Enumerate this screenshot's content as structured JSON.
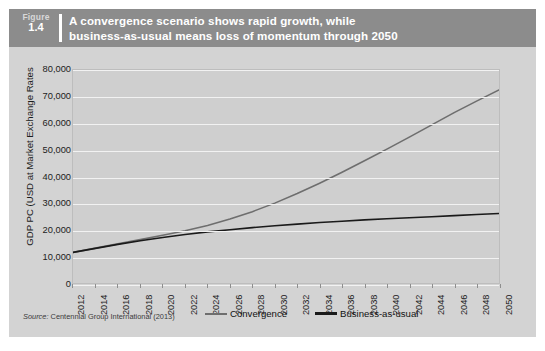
{
  "figure": {
    "label": "Figure",
    "number": "1.4",
    "title_line1": "A convergence scenario shows rapid growth, while",
    "title_line2": "business-as-usual means loss of momentum through 2050",
    "source": "Centennial Group International (2013)",
    "source_label": "Source:"
  },
  "colors": {
    "card_background": "#d3d3d3",
    "header_background": "#8c8c8c",
    "header_text": "#ffffff",
    "plot_background": "#cfcfcf",
    "gridline": "#f2f2f2",
    "convergence_line": "#6e6e6e",
    "business_as_usual_line": "#1a1a1a"
  },
  "chart_data": {
    "type": "line",
    "title": "A convergence scenario shows rapid growth, while business-as-usual means loss of momentum through 2050",
    "xlabel": "",
    "ylabel": "GDP PC (USD at Market Exchange Rates",
    "xlim": [
      2012,
      2050
    ],
    "ylim": [
      0,
      80000
    ],
    "ytick_values": [
      0,
      10000,
      20000,
      30000,
      40000,
      50000,
      60000,
      70000,
      80000
    ],
    "ytick_labels": [
      "0",
      "10,000",
      "20,000",
      "30,000",
      "40,000",
      "50,000",
      "60,000",
      "70,000",
      "80,000"
    ],
    "x": [
      2012,
      2014,
      2016,
      2018,
      2020,
      2022,
      2024,
      2026,
      2028,
      2030,
      2032,
      2034,
      2036,
      2038,
      2040,
      2042,
      2044,
      2046,
      2048,
      2050
    ],
    "xtick_labels": [
      "2012",
      "2014",
      "2016",
      "2018",
      "2020",
      "2022",
      "2024",
      "2026",
      "2028",
      "2030",
      "2032",
      "2034",
      "2036",
      "2038",
      "2040",
      "2042",
      "2044",
      "2046",
      "2048",
      "2050"
    ],
    "grid": true,
    "grid_axis": "y",
    "legend_position": "bottom",
    "series": [
      {
        "name": "Convergence",
        "color": "#6e6e6e",
        "values": [
          11500,
          13100,
          14700,
          16300,
          17900,
          19600,
          21600,
          24000,
          26800,
          30000,
          33600,
          37500,
          41600,
          45900,
          50300,
          54800,
          59400,
          64000,
          68300,
          72500
        ]
      },
      {
        "name": "Business-as-usual",
        "color": "#1a1a1a",
        "values": [
          11500,
          13000,
          14500,
          15900,
          17100,
          18200,
          19200,
          20000,
          20800,
          21500,
          22100,
          22700,
          23200,
          23700,
          24100,
          24500,
          24900,
          25300,
          25700,
          26100
        ]
      }
    ]
  }
}
